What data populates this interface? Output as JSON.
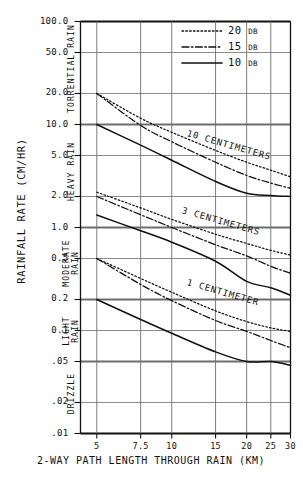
{
  "chart_data": {
    "type": "line",
    "title": "",
    "xlabel": "2-WAY PATH LENGTH THROUGH RAIN (KM)",
    "ylabel": "RAINFALL RATE (CM/HR)",
    "xscale": "log",
    "yscale": "log",
    "xlim": [
      4.3,
      30
    ],
    "ylim": [
      0.01,
      100.0
    ],
    "grid": true,
    "x_ticks": [
      "5",
      "7.5",
      "10",
      "15",
      "20",
      "25",
      "30"
    ],
    "x_tick_values": [
      5,
      7.5,
      10,
      15,
      20,
      25,
      30
    ],
    "y_ticks": [
      "100.0",
      "50.0",
      "20.0",
      "10.0",
      "5.0",
      "2.0",
      "1.0",
      "0.5",
      "0.2",
      "0.1",
      ".05",
      ".02",
      ".01"
    ],
    "y_tick_values": [
      100.0,
      50.0,
      20.0,
      10.0,
      5.0,
      2.0,
      1.0,
      0.5,
      0.2,
      0.1,
      0.05,
      0.02,
      0.01
    ],
    "legend_position": "top-right",
    "legend": [
      {
        "label": "20",
        "unit": "DB",
        "style": "dotted"
      },
      {
        "label": "15",
        "unit": "DB",
        "style": "dash-dot"
      },
      {
        "label": "10",
        "unit": "DB",
        "style": "solid"
      }
    ],
    "band_labels": [
      {
        "text": "TORRENTIAL RAIN",
        "range": [
          10.0,
          100.0
        ]
      },
      {
        "text": "HEAVY RAIN",
        "range": [
          1.0,
          10.0
        ]
      },
      {
        "text": "MODERATE RAIN",
        "range": [
          0.2,
          1.0
        ]
      },
      {
        "text": "LIGHT RAIN",
        "range": [
          0.05,
          0.2
        ]
      },
      {
        "text": "DRIZZLE",
        "range": [
          0.01,
          0.05
        ]
      }
    ],
    "band_boundaries": [
      10.0,
      1.0,
      0.2,
      0.05
    ],
    "annotations": [
      {
        "text": "10 CENTIMETERS",
        "x": 11.5,
        "y": 8.0
      },
      {
        "text": "3 CENTIMETERS",
        "x": 11.0,
        "y": 1.45
      },
      {
        "text": "1 CENTIMETER",
        "x": 11.5,
        "y": 0.29
      }
    ],
    "series": [
      {
        "name": "10 CENTIMETERS 20 DB",
        "group": "10 CENTIMETERS",
        "attenuation_db": 20,
        "style": "dotted",
        "x": [
          5,
          7.5,
          10,
          15,
          20,
          25,
          30
        ],
        "y": [
          20.0,
          11.5,
          8.4,
          5.6,
          4.3,
          3.6,
          3.1
        ]
      },
      {
        "name": "10 CENTIMETERS 15 DB",
        "group": "10 CENTIMETERS",
        "attenuation_db": 15,
        "style": "dash-dot",
        "x": [
          5,
          7.5,
          10,
          15,
          20,
          25,
          30
        ],
        "y": [
          20.0,
          9.8,
          6.8,
          4.3,
          3.2,
          2.7,
          2.4
        ]
      },
      {
        "name": "10 CENTIMETERS 10 DB",
        "group": "10 CENTIMETERS",
        "attenuation_db": 10,
        "style": "solid",
        "x": [
          5,
          7.5,
          10,
          15,
          20,
          25,
          30
        ],
        "y": [
          10.0,
          6.3,
          4.5,
          2.8,
          2.15,
          2.05,
          2.0
        ]
      },
      {
        "name": "3 CENTIMETERS 20 DB",
        "group": "3 CENTIMETERS",
        "attenuation_db": 20,
        "style": "dotted",
        "x": [
          5,
          7.5,
          10,
          15,
          20,
          25,
          30
        ],
        "y": [
          2.2,
          1.55,
          1.2,
          0.86,
          0.7,
          0.6,
          0.54
        ]
      },
      {
        "name": "3 CENTIMETERS 15 DB",
        "group": "3 CENTIMETERS",
        "attenuation_db": 15,
        "style": "dash-dot",
        "x": [
          5,
          7.5,
          10,
          15,
          20,
          25,
          30
        ],
        "y": [
          2.0,
          1.33,
          1.0,
          0.68,
          0.53,
          0.42,
          0.36
        ]
      },
      {
        "name": "3 CENTIMETERS 10 DB",
        "group": "3 CENTIMETERS",
        "attenuation_db": 10,
        "style": "solid",
        "x": [
          5,
          7.5,
          10,
          15,
          20,
          25,
          30
        ],
        "y": [
          1.32,
          0.93,
          0.72,
          0.47,
          0.3,
          0.26,
          0.22
        ]
      },
      {
        "name": "1 CENTIMETER 20 DB",
        "group": "1 CENTIMETER",
        "attenuation_db": 20,
        "style": "dotted",
        "x": [
          5,
          7.5,
          10,
          15,
          20,
          25,
          30
        ],
        "y": [
          0.5,
          0.32,
          0.235,
          0.155,
          0.122,
          0.106,
          0.098
        ]
      },
      {
        "name": "1 CENTIMETER 15 DB",
        "group": "1 CENTIMETER",
        "attenuation_db": 15,
        "style": "dash-dot",
        "x": [
          5,
          7.5,
          10,
          15,
          20,
          25,
          30
        ],
        "y": [
          0.5,
          0.28,
          0.195,
          0.125,
          0.098,
          0.08,
          0.068
        ]
      },
      {
        "name": "1 CENTIMETER 10 DB",
        "group": "1 CENTIMETER",
        "attenuation_db": 10,
        "style": "solid",
        "x": [
          5,
          7.5,
          10,
          15,
          20,
          25,
          30
        ],
        "y": [
          0.2,
          0.128,
          0.094,
          0.062,
          0.05,
          0.05,
          0.046
        ]
      }
    ]
  }
}
